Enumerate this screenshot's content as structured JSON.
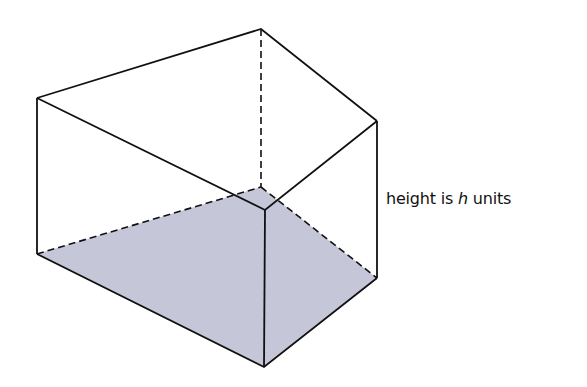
{
  "figure": {
    "type": "triangular prism (pentagonal-looking solid with shaded base)",
    "colors": {
      "stroke": "#111111",
      "base_fill": "#c5c6d8",
      "background": "#ffffff"
    },
    "vertices": {
      "top_left": [
        37,
        98
      ],
      "top_back": [
        261,
        29
      ],
      "top_right": [
        377,
        121
      ],
      "top_front": [
        265,
        210
      ],
      "bottom_left": [
        37,
        254
      ],
      "bottom_back": [
        261,
        187
      ],
      "bottom_right": [
        377,
        278
      ],
      "bottom_front": [
        264,
        367
      ]
    }
  },
  "label": {
    "prefix": "height is ",
    "variable": "h",
    "suffix": " units"
  }
}
